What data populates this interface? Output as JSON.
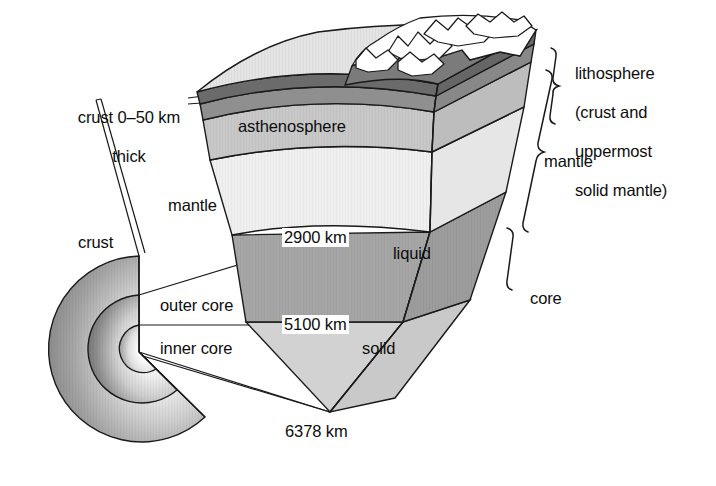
{
  "figure": {
    "background_color": "#ffffff",
    "line_color": "#1a1a1a"
  },
  "labels": {
    "crust_thickness_line1": "crust 0–50 km",
    "crust_thickness_line2": "thick",
    "mantle_left": "mantle",
    "crust_sphere": "crust",
    "outer_core": "outer core",
    "inner_core": "inner core",
    "asthenosphere": "asthenosphere",
    "lithosphere_line1": "lithosphere",
    "lithosphere_line2": "(crust and",
    "lithosphere_line3": "uppermost",
    "lithosphere_line4": "solid mantle)",
    "mantle_right": "mantle",
    "core_right": "core",
    "liquid": "liquid",
    "solid": "solid",
    "depth_2900": "2900 km",
    "depth_5100": "5100 km",
    "depth_6378": "6378 km"
  },
  "depths": {
    "crust_min_km": 0,
    "crust_max_km": 50,
    "mantle_core_boundary_km": 2900,
    "outer_inner_core_boundary_km": 5100,
    "earth_radius_km": 6378
  },
  "layers": [
    {
      "name": "crust",
      "fill": "#6e6e6e"
    },
    {
      "name": "uppermost-solid-mantle",
      "fill": "#8f8f8f"
    },
    {
      "name": "asthenosphere",
      "fill": "#c6c6c6"
    },
    {
      "name": "lower-mantle",
      "fill": "#ededed"
    },
    {
      "name": "outer-core-liquid",
      "fill": "#a6a6a6"
    },
    {
      "name": "inner-core-solid",
      "fill": "#d2d2d2"
    }
  ],
  "sphere": {
    "shells": [
      "mantle-shell",
      "outer-core-shell",
      "inner-core-shell"
    ],
    "shading": "radial-gradient-dark-outer-light-inner"
  }
}
